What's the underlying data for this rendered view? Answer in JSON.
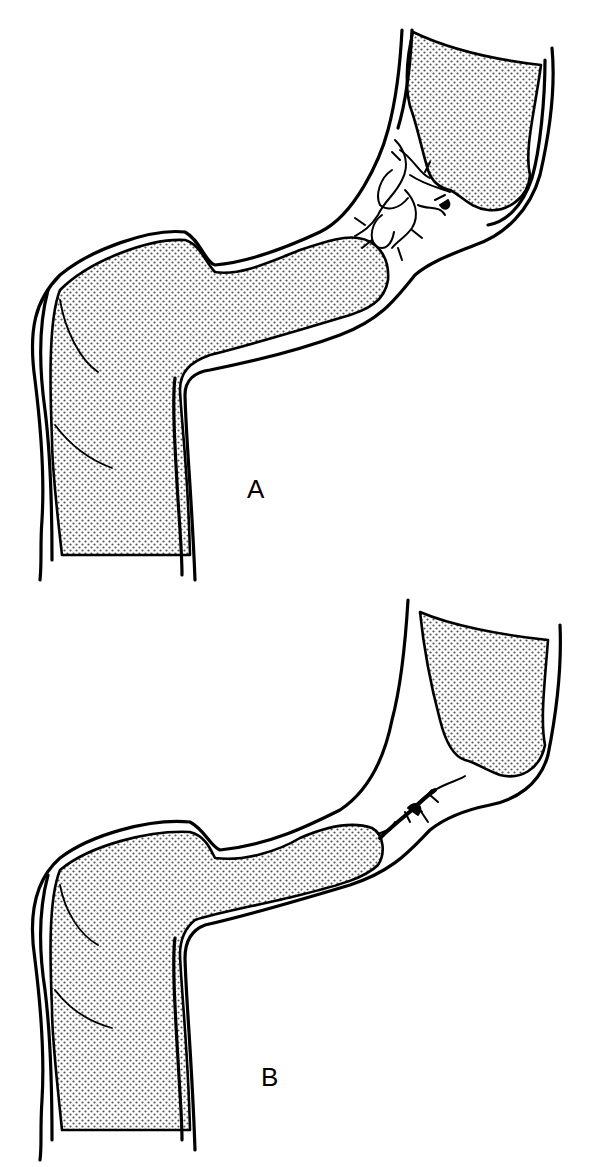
{
  "figure": {
    "panels": [
      {
        "id": "A",
        "label": "A",
        "description": "Bowel segment with extensive web-like branching lesion across narrowed junction between two stippled lumina"
      },
      {
        "id": "B",
        "label": "B",
        "description": "Same bowel segment with small compact lesion at narrowed junction"
      }
    ],
    "colors": {
      "ink": "#000000",
      "background": "#ffffff",
      "stipple": "#555555"
    }
  }
}
